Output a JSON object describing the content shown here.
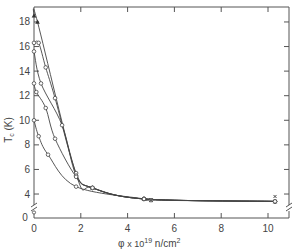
{
  "chart_data": {
    "type": "line",
    "title": "",
    "xlabel": "φ x 10^19 n/cm^2",
    "xlabel_parts": {
      "phi": "φ",
      "times": "x 10",
      "exp": "19",
      "unit": " n/cm",
      "unit_exp": "2"
    },
    "ylabel": "Tc (K)",
    "ylabel_parts": {
      "main": "T",
      "sub": "c",
      "unit": " (K)"
    },
    "xlim": [
      0,
      10.9
    ],
    "ylim": [
      2,
      18.9
    ],
    "x_ticks": [
      0,
      2,
      4,
      6,
      8,
      10
    ],
    "x_tick_labels": [
      "0",
      "2",
      "4",
      "6",
      "8",
      "10"
    ],
    "y_ticks": [
      4,
      6,
      8,
      10,
      12,
      14,
      16,
      18
    ],
    "y_tick_labels": [
      "4",
      "6",
      "8",
      "10",
      "12",
      "14",
      "16",
      "18"
    ],
    "origin_label": "0",
    "axis_break": true,
    "grid": false,
    "legend": "none",
    "series": [
      {
        "name": "curve-1",
        "marker": "triangle",
        "x": [
          0.0,
          0.15,
          1.8,
          2.5,
          4.7,
          10.3
        ],
        "y": [
          18.5,
          18.0,
          5.6,
          4.5,
          3.6,
          3.4
        ]
      },
      {
        "name": "curve-2",
        "marker": "circle",
        "x": [
          0.0,
          0.2,
          0.5,
          0.9,
          1.8,
          2.5,
          4.7,
          10.3
        ],
        "y": [
          16.3,
          16.3,
          14.3,
          11.8,
          5.7,
          4.5,
          3.6,
          3.4
        ]
      },
      {
        "name": "curve-3",
        "marker": "circle",
        "x": [
          0.0,
          0.3,
          1.2,
          1.8,
          2.5,
          4.7,
          10.3
        ],
        "y": [
          15.6,
          13.0,
          9.6,
          5.5,
          4.5,
          3.6,
          3.4
        ]
      },
      {
        "name": "curve-4",
        "marker": "circle",
        "x": [
          0.0,
          0.1,
          0.5,
          0.9,
          1.8,
          2.5,
          4.7,
          10.3
        ],
        "y": [
          13.0,
          12.3,
          11.0,
          8.5,
          5.4,
          4.5,
          3.6,
          3.4
        ]
      },
      {
        "name": "curve-5",
        "marker": "circle",
        "x": [
          0.0,
          0.2,
          0.6,
          1.8,
          4.7,
          5.0,
          10.3
        ],
        "y": [
          10.0,
          8.7,
          7.2,
          4.6,
          3.6,
          3.5,
          3.4
        ]
      }
    ],
    "annotations": [
      {
        "x": 5.0,
        "y": 3.5,
        "marker": "x"
      },
      {
        "x": 10.3,
        "y": 3.8,
        "marker": "small-x"
      },
      {
        "x": 0.0,
        "y": 2.5,
        "marker": "circle"
      }
    ]
  }
}
